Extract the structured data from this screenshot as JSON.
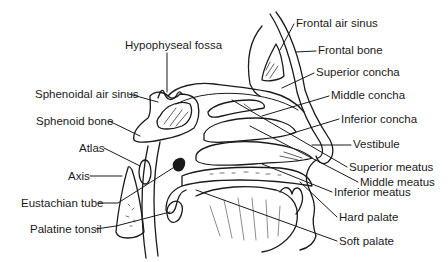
{
  "diagram": {
    "labels": [
      {
        "id": "hypophyseal-fossa",
        "text": "Hypophyseal fossa",
        "x": 125,
        "y": 45
      },
      {
        "id": "sphenoidal-air-sinus",
        "text": "Sphenoidal air sinus",
        "x": 35,
        "y": 89
      },
      {
        "id": "sphenoid-bone",
        "text": "Sphenoid bone",
        "x": 36,
        "y": 117
      },
      {
        "id": "atlas",
        "text": "Atlas",
        "x": 79,
        "y": 144
      },
      {
        "id": "axis",
        "text": "Axis",
        "x": 68,
        "y": 171
      },
      {
        "id": "eustachian-tube",
        "text": "Eustachian tube",
        "x": 21,
        "y": 198
      },
      {
        "id": "palatine-tonsil",
        "text": "Palatine tonsil",
        "x": 30,
        "y": 225
      },
      {
        "id": "frontal-air-sinus",
        "text": "Frontal air sinus",
        "x": 296,
        "y": 18
      },
      {
        "id": "frontal-bone",
        "text": "Frontal bone",
        "x": 318,
        "y": 46
      },
      {
        "id": "superior-concha",
        "text": "Superior concha",
        "x": 316,
        "y": 68
      },
      {
        "id": "middle-concha",
        "text": "Middle concha",
        "x": 331,
        "y": 91
      },
      {
        "id": "inferior-concha",
        "text": "Inferior concha",
        "x": 341,
        "y": 114
      },
      {
        "id": "vestibule",
        "text": "Vestibule",
        "x": 353,
        "y": 140
      },
      {
        "id": "superior-meatus",
        "text": "Superior meatus",
        "x": 349,
        "y": 163
      },
      {
        "id": "middle-meatus",
        "text": "Middle meatus",
        "x": 360,
        "y": 178
      },
      {
        "id": "inferior-meatus",
        "text": "Inferior meatus",
        "x": 334,
        "y": 188
      },
      {
        "id": "hard-palate",
        "text": "Hard palate",
        "x": 339,
        "y": 213
      },
      {
        "id": "soft-palate",
        "text": "Soft palate",
        "x": 339,
        "y": 237
      }
    ],
    "colors": {
      "line": "#1a1a1a",
      "background": "#ffffff"
    }
  }
}
